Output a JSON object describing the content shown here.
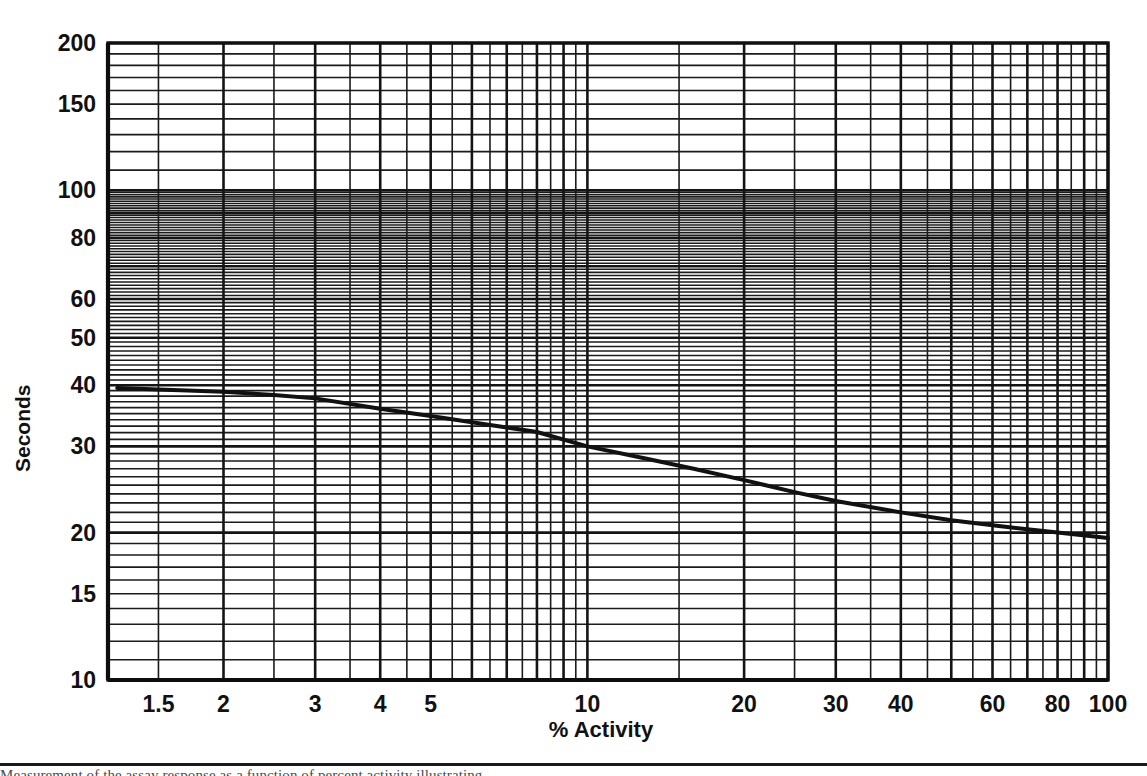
{
  "chart_data": {
    "type": "line",
    "title": "",
    "xlabel": "% Activity",
    "ylabel": "Seconds",
    "xscale": "log",
    "yscale": "log",
    "xlim": [
      1.2,
      100
    ],
    "ylim": [
      10,
      200
    ],
    "grid": true,
    "grid_style": "log-log graph paper (minor lines on both axes)",
    "legend": "none",
    "xticklabels": [
      "1.5",
      "2",
      "3",
      "4",
      "5",
      "10",
      "20",
      "30",
      "40",
      "60",
      "80",
      "100"
    ],
    "xtickvalues": [
      1.5,
      2,
      3,
      4,
      5,
      10,
      20,
      30,
      40,
      60,
      80,
      100
    ],
    "yticklabels": [
      "200",
      "150",
      "100",
      "80",
      "60",
      "50",
      "40",
      "30",
      "20",
      "15",
      "10"
    ],
    "ytickvalues": [
      200,
      150,
      100,
      80,
      60,
      50,
      40,
      30,
      20,
      15,
      10
    ],
    "x_major_lines": [
      2,
      3,
      4,
      5,
      6,
      7,
      8,
      9,
      10,
      20,
      30,
      40,
      50,
      60,
      70,
      80,
      90,
      100
    ],
    "y_major_lines": [
      10,
      20,
      30,
      40,
      50,
      60,
      70,
      80,
      90,
      100,
      200
    ],
    "series": [
      {
        "name": "Assay time vs % activity",
        "color": "#111111",
        "linewidth": 4,
        "x": [
          1.25,
          1.5,
          2,
          2.5,
          3,
          4,
          5,
          6,
          7,
          8,
          10,
          13,
          16,
          20,
          25,
          30,
          40,
          50,
          60,
          80,
          100
        ],
        "y": [
          39.5,
          39.2,
          38.8,
          38.2,
          37.6,
          35.8,
          34.6,
          33.6,
          32.8,
          32.1,
          30.0,
          28.3,
          27.0,
          25.6,
          24.2,
          23.2,
          22.0,
          21.2,
          20.7,
          20.0,
          19.5
        ]
      }
    ],
    "annotations": []
  },
  "plot_box": {
    "left_px": 108,
    "right_px": 1108,
    "top_px": 43,
    "bottom_px": 680
  },
  "footer": {
    "caption": "Measurement of the assay response as a function of percent activity illustrating"
  }
}
